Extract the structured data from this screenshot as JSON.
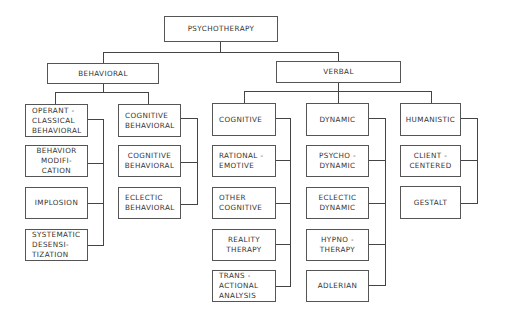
{
  "diagram": {
    "root": {
      "label": "PSYCHOTHERAPY"
    },
    "branches": [
      {
        "label": "BEHAVIORAL",
        "groups": [
          {
            "items": [
              "OPERANT -\nCLASSICAL\nBEHAVIORAL",
              "BEHAVIOR\nMODIFI-\nCATION",
              "IMPLOSION",
              "SYSTEMATIC\nDESENSI-\nTIZATION"
            ]
          },
          {
            "items": [
              "COGNITIVE\nBEHAVIORAL",
              "COGNITIVE\nBEHAVIORAL",
              "ECLECTIC\nBEHAVIORAL"
            ]
          }
        ]
      },
      {
        "label": "VERBAL",
        "groups": [
          {
            "items": [
              "COGNITIVE",
              "RATIONAL -\nEMOTIVE",
              "OTHER\nCOGNITIVE",
              "REALITY\nTHERAPY",
              "TRANS -\nACTIONAL\nANALYSIS"
            ]
          },
          {
            "items": [
              "DYNAMIC",
              "PSYCHO -\nDYNAMIC",
              "ECLECTIC\nDYNAMIC",
              "HYPNO -\nTHERAPY",
              "ADLERIAN"
            ]
          },
          {
            "items": [
              "HUMANISTIC",
              "CLIENT -\nCENTERED",
              "GESTALT"
            ]
          }
        ]
      }
    ]
  }
}
